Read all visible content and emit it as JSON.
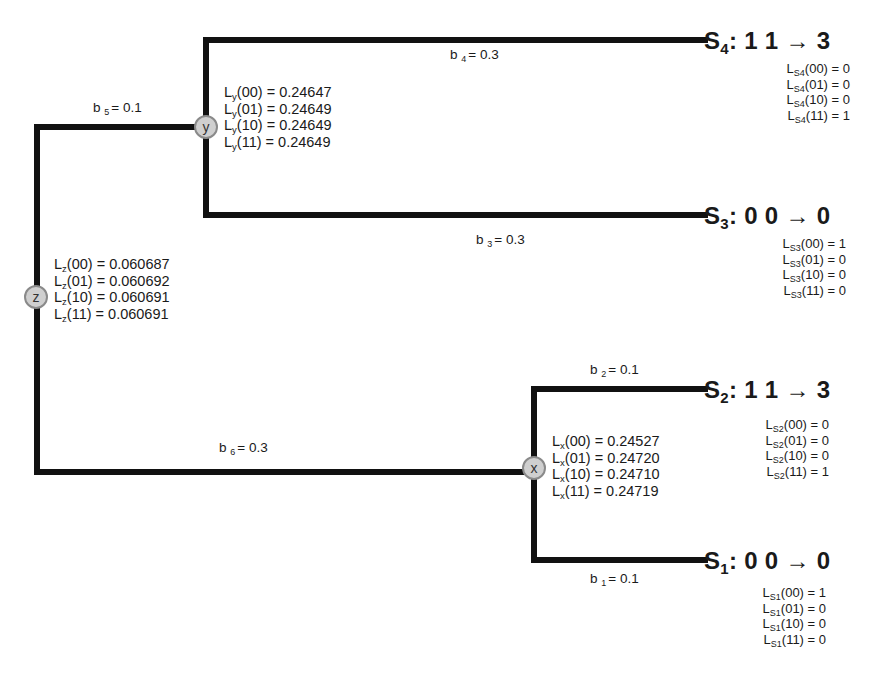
{
  "diagram": {
    "type": "phylogenetic-tree-likelihood",
    "edge_color": "#111111",
    "node_fill": "#cfcfcf",
    "node_border": "#8a8a8a"
  },
  "nodes": {
    "z": {
      "label": "z",
      "likelihoods": [
        {
          "L": "L",
          "sub": "z",
          "state": "(00)",
          "eq": " = 0.060687"
        },
        {
          "L": "L",
          "sub": "z",
          "state": "(01)",
          "eq": " = 0.060692"
        },
        {
          "L": "L",
          "sub": "z",
          "state": "(10)",
          "eq": " = 0.060691"
        },
        {
          "L": "L",
          "sub": "z",
          "state": "(11)",
          "eq": " = 0.060691"
        }
      ]
    },
    "y": {
      "label": "y",
      "likelihoods": [
        {
          "L": "L",
          "sub": "y",
          "state": "(00)",
          "eq": " = 0.24647"
        },
        {
          "L": "L",
          "sub": "y",
          "state": "(01)",
          "eq": " = 0.24649"
        },
        {
          "L": "L",
          "sub": "y",
          "state": "(10)",
          "eq": " = 0.24649"
        },
        {
          "L": "L",
          "sub": "y",
          "state": "(11)",
          "eq": " = 0.24649"
        }
      ]
    },
    "x": {
      "label": "x",
      "likelihoods": [
        {
          "L": "L",
          "sub": "x",
          "state": "(00)",
          "eq": " = 0.24527"
        },
        {
          "L": "L",
          "sub": "x",
          "state": "(01)",
          "eq": " = 0.24720"
        },
        {
          "L": "L",
          "sub": "x",
          "state": "(10)",
          "eq": " = 0.24710"
        },
        {
          "L": "L",
          "sub": "x",
          "state": "(11)",
          "eq": " = 0.24719"
        }
      ]
    }
  },
  "branches": {
    "b1": {
      "b": "b",
      "sub": "1",
      "eq": "= 0.1"
    },
    "b2": {
      "b": "b",
      "sub": "2",
      "eq": "= 0.1"
    },
    "b3": {
      "b": "b",
      "sub": "3",
      "eq": "= 0.3"
    },
    "b4": {
      "b": "b",
      "sub": "4",
      "eq": "= 0.3"
    },
    "b5": {
      "b": "b",
      "sub": "5",
      "eq": "= 0.1"
    },
    "b6": {
      "b": "b",
      "sub": "6",
      "eq": "= 0.3"
    }
  },
  "leaves": {
    "S4": {
      "S": "S",
      "sub": "4",
      "text": ": 1 1 → 3",
      "likelihoods": [
        {
          "L": "L",
          "sub": "S4",
          "state": "(00)",
          "eq": " = 0"
        },
        {
          "L": "L",
          "sub": "S4",
          "state": "(01)",
          "eq": " = 0"
        },
        {
          "L": "L",
          "sub": "S4",
          "state": "(10)",
          "eq": " = 0"
        },
        {
          "L": "L",
          "sub": "S4",
          "state": "(11)",
          "eq": " = 1"
        }
      ]
    },
    "S3": {
      "S": "S",
      "sub": "3",
      "text": ": 0 0 → 0",
      "likelihoods": [
        {
          "L": "L",
          "sub": "S3",
          "state": "(00)",
          "eq": " = 1"
        },
        {
          "L": "L",
          "sub": "S3",
          "state": "(01)",
          "eq": " = 0"
        },
        {
          "L": "L",
          "sub": "S3",
          "state": "(10)",
          "eq": " = 0"
        },
        {
          "L": "L",
          "sub": "S3",
          "state": "(11)",
          "eq": " = 0"
        }
      ]
    },
    "S2": {
      "S": "S",
      "sub": "2",
      "text": ": 1 1 → 3",
      "likelihoods": [
        {
          "L": "L",
          "sub": "S2",
          "state": "(00)",
          "eq": " = 0"
        },
        {
          "L": "L",
          "sub": "S2",
          "state": "(01)",
          "eq": " = 0"
        },
        {
          "L": "L",
          "sub": "S2",
          "state": "(10)",
          "eq": " = 0"
        },
        {
          "L": "L",
          "sub": "S2",
          "state": "(11)",
          "eq": " = 1"
        }
      ]
    },
    "S1": {
      "S": "S",
      "sub": "1",
      "text": ": 0 0 → 0",
      "likelihoods": [
        {
          "L": "L",
          "sub": "S1",
          "state": "(00)",
          "eq": " = 1"
        },
        {
          "L": "L",
          "sub": "S1",
          "state": "(01)",
          "eq": " = 0"
        },
        {
          "L": "L",
          "sub": "S1",
          "state": "(10)",
          "eq": " = 0"
        },
        {
          "L": "L",
          "sub": "S1",
          "state": "(11)",
          "eq": " = 0"
        }
      ]
    }
  }
}
